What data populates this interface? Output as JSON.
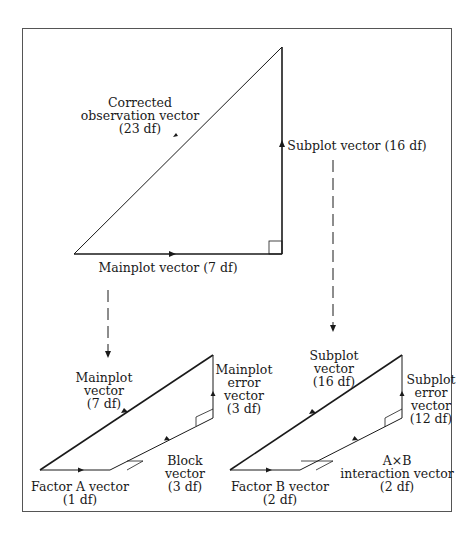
{
  "top": {
    "hypotenuse": {
      "lines": [
        "Corrected",
        "observation vector",
        "(23 df)"
      ]
    },
    "vertical": {
      "lines": [
        "Subplot vector (16 df)"
      ]
    },
    "horizontal": {
      "lines": [
        "Mainplot vector (7 df)"
      ]
    }
  },
  "bottom_left": {
    "hypotenuse": {
      "lines": [
        "Mainplot",
        "vector",
        "(7 df)"
      ]
    },
    "vertical": {
      "lines": [
        "Mainplot",
        "error",
        "vector",
        "(3 df)"
      ]
    },
    "slanted": {
      "lines": [
        "Block",
        "vector",
        "(3 df)"
      ]
    },
    "horizontal": {
      "lines": [
        "Factor A vector",
        "(1 df)"
      ]
    }
  },
  "bottom_right": {
    "hypotenuse": {
      "lines": [
        "Subplot",
        "vector",
        "(16 df)"
      ]
    },
    "vertical": {
      "lines": [
        "Subplot",
        "error",
        "vector",
        "(12 df)"
      ]
    },
    "slanted": {
      "lines": [
        "A×B",
        "interaction vector",
        "(2 df)"
      ]
    },
    "horizontal": {
      "lines": [
        "Factor B vector",
        "(2 df)"
      ]
    }
  },
  "colors": {
    "line": "#1a1a1a",
    "frame": "#555555",
    "background": "#ffffff"
  }
}
